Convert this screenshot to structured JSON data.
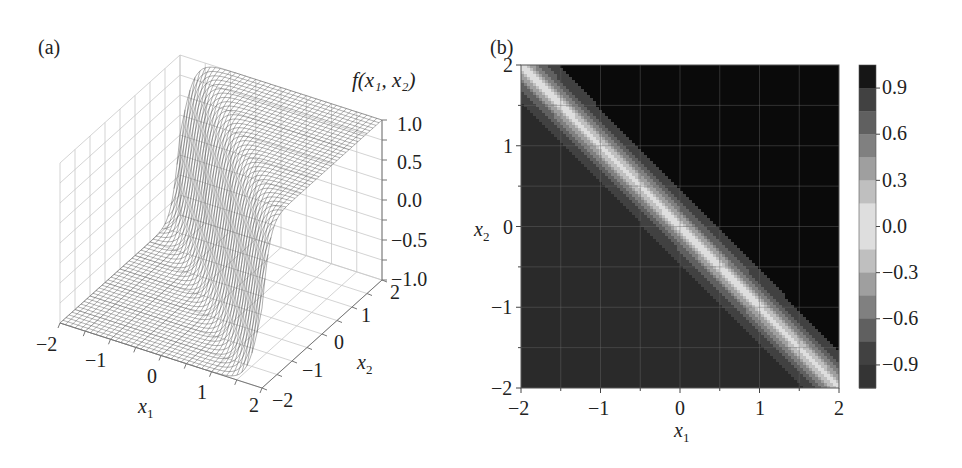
{
  "panels": {
    "a": {
      "label": "(a)"
    },
    "b": {
      "label": "(b)"
    }
  },
  "chart_data": [
    {
      "panel": "(a)",
      "type": "surface3d",
      "title": "",
      "function": "f(x1, x2)",
      "xlabel": "x1",
      "ylabel": "x2",
      "zlabel": "f(x1, x2)",
      "x_ticks": [
        "-2",
        "-1",
        "0",
        "1",
        "2"
      ],
      "y_ticks": [
        "-2",
        "-1",
        "0",
        "1",
        "2"
      ],
      "z_ticks": [
        "-1.0",
        "-0.5",
        "0.0",
        "0.5",
        "1.0"
      ],
      "xlim": [
        -2,
        2
      ],
      "ylim": [
        -2,
        2
      ],
      "zlim": [
        -1,
        1
      ],
      "description": "Wireframe surface: f ≈ -1 for x1 + x2 < 0, sharp transition near x1 + x2 = 0 (with a small dip), f ≈ 1 for x1 + x2 > 0",
      "grid": true,
      "style": "wireframe, grayscale"
    },
    {
      "panel": "(b)",
      "type": "heatmap",
      "subtype": "filled contour",
      "title": "",
      "xlabel": "x1",
      "ylabel": "x2",
      "x_ticks": [
        "-2",
        "-1",
        "0",
        "1",
        "2"
      ],
      "y_ticks": [
        "-2",
        "-1",
        "0",
        "1",
        "2"
      ],
      "xlim": [
        -2,
        2
      ],
      "ylim": [
        -2,
        2
      ],
      "grid": true,
      "description": "Lower-left triangle (x1 + x2 < 0) ≈ -1 (dark), upper-right (x1 + x2 > 0) ≈ 1 (black), bright band (≈0) along the diagonal x1 + x2 ≈ 0",
      "colorbar": {
        "ticks": [
          "0.9",
          "0.6",
          "0.3",
          "0.0",
          "-0.3",
          "-0.6",
          "-0.9"
        ],
        "range": [
          -1.05,
          1.05
        ],
        "levels": 14,
        "colormap": "grayscale (light at 0, dark at ±1)"
      }
    }
  ],
  "axes_a": {
    "z_title": "f",
    "z_title_args": "(x₁, x₂)",
    "z_ticks": [
      "1.0",
      "0.5",
      "0.0",
      "−0.5",
      "−1.0"
    ],
    "x_ticks": [
      "−2",
      "−1",
      "0",
      "1",
      "2"
    ],
    "y_ticks": [
      "−2",
      "−1",
      "0",
      "1",
      "2"
    ],
    "x_label": "x",
    "x_label_sub": "1",
    "y_label": "x",
    "y_label_sub": "2"
  },
  "axes_b": {
    "x_ticks": [
      "−2",
      "−1",
      "0",
      "1",
      "2"
    ],
    "y_ticks": [
      "2",
      "1",
      "0",
      "−1",
      "−2"
    ],
    "x_label": "x",
    "x_label_sub": "1",
    "y_label": "x",
    "y_label_sub": "2",
    "cbar_ticks": [
      "0.9",
      "0.6",
      "0.3",
      "0.0",
      "−0.3",
      "−0.6",
      "−0.9"
    ]
  }
}
